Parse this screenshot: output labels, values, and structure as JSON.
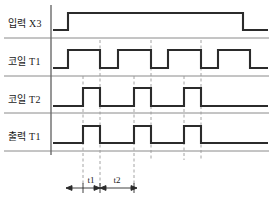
{
  "diagram": {
    "type": "timing",
    "width": 273,
    "height": 207,
    "background": "#ffffff",
    "line_color": "#2b2b2b",
    "guide_color": "#9a9a9a",
    "separator_color": "#8a8a8a"
  },
  "rows": [
    {
      "id": "input-x3",
      "label": "입력 X3",
      "label_x": 8,
      "label_y": 27,
      "baseline_y": 30,
      "high_y": 13,
      "separator_y": 38,
      "path": "M 53,30 L 68,30 L 68,13 L 243,13 L 243,30 L 268,30"
    },
    {
      "id": "coil-t1",
      "label": "코일 T1",
      "label_x": 8,
      "label_y": 65,
      "baseline_y": 68,
      "high_y": 50,
      "separator_y": 76,
      "path": "M 53,68 L 68,68 L 68,50 L 100,50 L 100,68 L 118,68 L 118,50 L 151,50 L 151,68 L 168,68 L 168,50 L 201,50 L 201,68 L 218,68 L 218,50 L 250,50 L 250,68 L 268,68"
    },
    {
      "id": "coil-t2",
      "label": "코일 T2",
      "label_x": 8,
      "label_y": 103,
      "baseline_y": 106,
      "high_y": 88,
      "separator_y": 113,
      "path": "M 53,106 L 83,106 L 83,88 L 100,88 L 100,106 L 134,106 L 134,88 L 151,88 L 151,106 L 184,106 L 184,88 L 201,88 L 201,106 L 268,106"
    },
    {
      "id": "output-t1",
      "label": "출력 T1",
      "label_x": 8,
      "label_y": 140,
      "baseline_y": 143,
      "high_y": 126,
      "separator_y": 151,
      "path": "M 53,143 L 83,143 L 83,126 L 100,126 L 100,143 L 134,143 L 134,126 L 151,126 L 151,143 L 184,143 L 184,126 L 201,126 L 201,143 L 268,143"
    }
  ],
  "axis": {
    "x": 51,
    "y_top": 5,
    "y_bottom": 155
  },
  "separators": {
    "x_start": 4,
    "x_end": 269
  },
  "guides": [
    {
      "id": "guide-1",
      "x": 83,
      "y_top": 76,
      "y_bottom": 186
    },
    {
      "id": "guide-2",
      "x": 100,
      "y_top": 40,
      "y_bottom": 186
    },
    {
      "id": "guide-3",
      "x": 134,
      "y_top": 76,
      "y_bottom": 186
    },
    {
      "id": "guide-4",
      "x": 151,
      "y_top": 40,
      "y_bottom": 186
    },
    {
      "id": "guide-5",
      "x": 184,
      "y_top": 76,
      "y_bottom": 160
    },
    {
      "id": "guide-6",
      "x": 201,
      "y_top": 40,
      "y_bottom": 160
    }
  ],
  "annotations": {
    "dim_y": 188,
    "tick_half_height": 5,
    "intervals": [
      {
        "id": "t1",
        "label": "t1",
        "x_start": 83,
        "x_end": 100,
        "label_x": 91,
        "label_y": 183
      },
      {
        "id": "t2",
        "label": "t2",
        "x_start": 100,
        "x_end": 134,
        "label_x": 117,
        "label_y": 183
      }
    ],
    "leader_x_start": 66,
    "leader_x_end": 137
  }
}
